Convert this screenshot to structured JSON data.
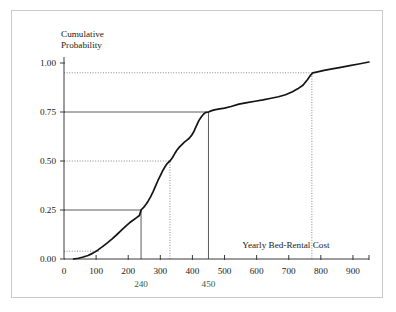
{
  "figure": {
    "frame_color": "#c9c9cf",
    "background": "#ffffff"
  },
  "axes": {
    "y_title_line1": "Cumulative",
    "y_title_line2": "Probability",
    "x_title": "Yearly Bed-Rental Cost",
    "y_ticks": [
      "0.00",
      "0.25",
      "0.50",
      "0.75",
      "1.00"
    ],
    "x_ticks": [
      "0",
      "100",
      "200",
      "300",
      "400",
      "500",
      "600",
      "700",
      "800",
      "900"
    ]
  },
  "annotations": {
    "x240": "240",
    "x450": "450",
    "color": "#2e5e4e"
  },
  "chart_data": {
    "type": "line",
    "title": "",
    "subtitle": "",
    "xlabel": "Yearly Bed-Rental Cost",
    "ylabel": "Cumulative Probability",
    "xlim": [
      0,
      950
    ],
    "ylim": [
      0.0,
      1.0
    ],
    "grid": false,
    "legend": null,
    "x_tick_values": [
      0,
      100,
      200,
      300,
      400,
      500,
      600,
      700,
      800,
      900
    ],
    "y_tick_values": [
      0.0,
      0.25,
      0.5,
      0.75,
      1.0
    ],
    "series": [
      {
        "name": "Cumulative distribution of yearly bed-rental cost",
        "x": [
          30,
          45,
          60,
          75,
          90,
          105,
          120,
          135,
          150,
          165,
          180,
          195,
          205,
          215,
          225,
          235,
          240,
          248,
          255,
          262,
          270,
          278,
          285,
          292,
          300,
          308,
          315,
          322,
          330,
          338,
          345,
          352,
          360,
          368,
          375,
          382,
          390,
          398,
          405,
          412,
          420,
          428,
          435,
          442,
          450,
          460,
          472,
          485,
          500,
          520,
          545,
          570,
          595,
          620,
          645,
          668,
          690,
          710,
          728,
          745,
          758,
          768,
          775,
          790,
          810,
          835,
          862,
          890,
          918,
          950
        ],
        "y": [
          0.0,
          0.004,
          0.01,
          0.018,
          0.03,
          0.045,
          0.063,
          0.082,
          0.103,
          0.125,
          0.148,
          0.172,
          0.186,
          0.198,
          0.21,
          0.222,
          0.25,
          0.263,
          0.278,
          0.295,
          0.318,
          0.345,
          0.372,
          0.398,
          0.425,
          0.452,
          0.472,
          0.488,
          0.5,
          0.518,
          0.538,
          0.556,
          0.572,
          0.585,
          0.596,
          0.605,
          0.616,
          0.632,
          0.652,
          0.678,
          0.706,
          0.726,
          0.74,
          0.748,
          0.75,
          0.757,
          0.762,
          0.766,
          0.77,
          0.778,
          0.79,
          0.798,
          0.805,
          0.812,
          0.82,
          0.828,
          0.838,
          0.852,
          0.868,
          0.888,
          0.915,
          0.938,
          0.95,
          0.955,
          0.962,
          0.97,
          0.978,
          0.987,
          0.995,
          1.005
        ]
      }
    ],
    "reference_lines": [
      {
        "kind": "solid",
        "axis": "horizontal",
        "y": 0.25,
        "from_x": 0,
        "to_x": 240,
        "label": "quartile-1"
      },
      {
        "kind": "solid",
        "axis": "vertical",
        "x": 240,
        "from_y": 0.0,
        "to_y": 0.25,
        "label": "x-240"
      },
      {
        "kind": "solid",
        "axis": "horizontal",
        "y": 0.75,
        "from_x": 0,
        "to_x": 450,
        "label": "quartile-3"
      },
      {
        "kind": "solid",
        "axis": "vertical",
        "x": 450,
        "from_y": 0.0,
        "to_y": 0.75,
        "label": "x-450"
      },
      {
        "kind": "dotted",
        "axis": "horizontal",
        "y": 0.5,
        "from_x": 0,
        "to_x": 330,
        "label": "median"
      },
      {
        "kind": "dotted",
        "axis": "vertical",
        "x": 330,
        "from_y": 0.0,
        "to_y": 0.5,
        "label": "x-median"
      },
      {
        "kind": "dotted",
        "axis": "horizontal",
        "y": 0.95,
        "from_x": 0,
        "to_x": 772,
        "label": "p95"
      },
      {
        "kind": "dotted",
        "axis": "vertical",
        "x": 772,
        "from_y": 0.0,
        "to_y": 0.95,
        "label": "x-p95"
      },
      {
        "kind": "dotted",
        "axis": "horizontal",
        "y": 0.04,
        "from_x": 0,
        "to_x": 108,
        "label": "low-tail"
      }
    ]
  }
}
